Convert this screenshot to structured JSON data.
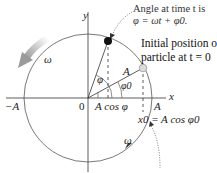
{
  "diagram": {
    "title_annotation": {
      "line1": "Angle at time t is",
      "line2": "φ = ωt + φ0."
    },
    "initial_position_annotation": {
      "line1": "Initial position of",
      "line2": "particle at t = 0"
    },
    "axes": {
      "x_label": "x",
      "y_label": "y",
      "origin_label": "0",
      "neg_amplitude_label": "−A",
      "pos_amplitude_label": "A"
    },
    "labels": {
      "radius_label": "A",
      "angle_phi": "φ",
      "angle_phi0": "φ0",
      "projection_label": "A cos φ",
      "x0_equation": "x0 = A cos φ0",
      "omega_top": "ω",
      "omega_bottom": "ω"
    },
    "colors": {
      "line": "#333333",
      "particle_current": "#111111",
      "particle_initial": "#d8d8d8",
      "rotation_arrow": "#aaaaaa"
    }
  }
}
